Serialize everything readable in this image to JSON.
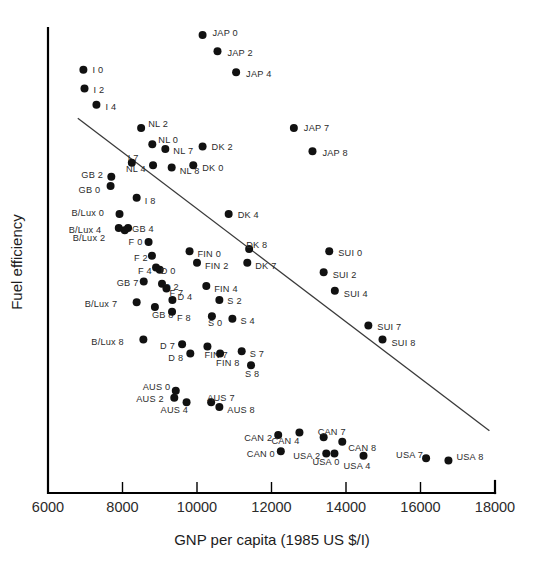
{
  "chart_data": {
    "type": "scatter",
    "title": "",
    "xlabel": "GNP per capita  (1985 US $/I)",
    "ylabel": "Fuel efficiency",
    "xlim": [
      6000,
      18000
    ],
    "ylim": [
      0,
      100
    ],
    "grid": false,
    "legend": "none",
    "xticks": [
      6000,
      8000,
      10000,
      12000,
      14000,
      16000,
      18000
    ],
    "xticklabels": [
      "6000",
      "8000",
      "10000",
      "12000",
      "14000",
      "16000",
      "18000"
    ],
    "yticks": [],
    "yticklabels": [],
    "trendline": {
      "label": "regression-line",
      "x": [
        6800,
        17850
      ],
      "y": [
        80.6,
        13.4
      ]
    },
    "points": [
      {
        "label": "JAP0",
        "text": "JAP 0",
        "x": 10150,
        "y": 98.5,
        "lx": 10.0,
        "ly": -1.5
      },
      {
        "label": "JAP2",
        "text": "JAP 2",
        "x": 10550,
        "y": 95.0,
        "lx": 10.0,
        "ly": 1.5
      },
      {
        "label": "JAP4",
        "text": "JAP 4",
        "x": 11050,
        "y": 90.5,
        "lx": 10.0,
        "ly": 2.0
      },
      {
        "label": "I0",
        "text": "I 0",
        "x": 6950,
        "y": 91.0,
        "lx": 9.0,
        "ly": 0.0
      },
      {
        "label": "I2",
        "text": "I 2",
        "x": 6980,
        "y": 87.0,
        "lx": 9.0,
        "ly": 2.0
      },
      {
        "label": "I4",
        "text": "I 4",
        "x": 7300,
        "y": 83.5,
        "lx": 9.0,
        "ly": 2.0
      },
      {
        "label": "NL2",
        "text": "NL 2",
        "x": 8500,
        "y": 78.5,
        "lx": 7.0,
        "ly": -3.5
      },
      {
        "label": "JAP7",
        "text": "JAP 7",
        "x": 12600,
        "y": 78.5,
        "lx": 10.0,
        "ly": 0.5
      },
      {
        "label": "NL0",
        "text": "NL 0",
        "x": 8800,
        "y": 75.0,
        "lx": 6.0,
        "ly": -4.0
      },
      {
        "label": "NL7",
        "text": "NL 7",
        "x": 9150,
        "y": 74.0,
        "lx": 8.0,
        "ly": 2.5
      },
      {
        "label": "DK2",
        "text": "DK 2",
        "x": 10150,
        "y": 74.5,
        "lx": 9.0,
        "ly": 0.5
      },
      {
        "label": "JAP8",
        "text": "JAP 8",
        "x": 13100,
        "y": 73.5,
        "lx": 10.0,
        "ly": 2.0
      },
      {
        "label": "I7",
        "text": "I 7",
        "x": 8250,
        "y": 71.0,
        "lx": -4.0,
        "ly": -4.5
      },
      {
        "label": "NL4",
        "text": "NL 4",
        "x": 8820,
        "y": 70.5,
        "lx": -27.0,
        "ly": 4.0
      },
      {
        "label": "NL8",
        "text": "NL 8",
        "x": 9320,
        "y": 70.0,
        "lx": 8.0,
        "ly": 3.0
      },
      {
        "label": "DK0",
        "text": "DK 0",
        "x": 9900,
        "y": 70.5,
        "lx": 9.0,
        "ly": 3.0
      },
      {
        "label": "GB2",
        "text": "GB 2",
        "x": 7700,
        "y": 68.0,
        "lx": -30.0,
        "ly": -2.0
      },
      {
        "label": "GB0",
        "text": "GB 0",
        "x": 7680,
        "y": 66.0,
        "lx": -32.0,
        "ly": 3.5
      },
      {
        "label": "I8",
        "text": "I 8",
        "x": 8380,
        "y": 63.5,
        "lx": 8.0,
        "ly": 3.0
      },
      {
        "label": "B/Lux0",
        "text": "B/Lux 0",
        "x": 7920,
        "y": 60.0,
        "lx": -48.0,
        "ly": -1.0
      },
      {
        "label": "DK4",
        "text": "DK 4",
        "x": 10850,
        "y": 60.0,
        "lx": 9.0,
        "ly": 1.0
      },
      {
        "label": "B/Lux4",
        "text": "B/Lux 4",
        "x": 7900,
        "y": 57.0,
        "lx": -50.0,
        "ly": 2.0
      },
      {
        "label": "GB4",
        "text": "GB 4",
        "x": 8150,
        "y": 57.0,
        "lx": 4.0,
        "ly": 1.5
      },
      {
        "label": "B/Lux2",
        "text": "B/Lux 2",
        "x": 8060,
        "y": 56.5,
        "lx": -52.0,
        "ly": 7.5
      },
      {
        "label": "F0",
        "text": "F 0",
        "x": 8700,
        "y": 54.0,
        "lx": -20.0,
        "ly": 0.0
      },
      {
        "label": "FIN0",
        "text": "FIN 0",
        "x": 9800,
        "y": 52.0,
        "lx": 8.0,
        "ly": 2.5
      },
      {
        "label": "DK8",
        "text": "DK 8",
        "x": 11400,
        "y": 52.5,
        "lx": -3.0,
        "ly": -4.0
      },
      {
        "label": "SUI0",
        "text": "SUI 0",
        "x": 13550,
        "y": 52.0,
        "lx": 9.0,
        "ly": 1.5
      },
      {
        "label": "F2",
        "text": "F 2",
        "x": 8790,
        "y": 51.0,
        "lx": -18.0,
        "ly": 2.5
      },
      {
        "label": "FIN2",
        "text": "FIN 2",
        "x": 10000,
        "y": 49.5,
        "lx": 8.0,
        "ly": 3.5
      },
      {
        "label": "DK7",
        "text": "DK 7",
        "x": 11350,
        "y": 49.5,
        "lx": 8.0,
        "ly": 3.0
      },
      {
        "label": "F4",
        "text": "F 4",
        "x": 8900,
        "y": 48.5,
        "lx": -18.0,
        "ly": 3.5
      },
      {
        "label": "D0",
        "text": "D 0",
        "x": 9000,
        "y": 48.0,
        "lx": 1.0,
        "ly": 1.0
      },
      {
        "label": "SUI2",
        "text": "SUI 2",
        "x": 13400,
        "y": 47.5,
        "lx": 9.0,
        "ly": 2.5
      },
      {
        "label": "GB7",
        "text": "GB 7",
        "x": 8570,
        "y": 45.5,
        "lx": -27.0,
        "ly": 1.5
      },
      {
        "label": "D2",
        "text": "D 2",
        "x": 9060,
        "y": 45.0,
        "lx": 2.0,
        "ly": 3.5
      },
      {
        "label": "F7",
        "text": "F 7",
        "x": 9180,
        "y": 44.0,
        "lx": 3.0,
        "ly": 5.0
      },
      {
        "label": "FIN4",
        "text": "FIN 4",
        "x": 10250,
        "y": 44.5,
        "lx": 8.0,
        "ly": 3.0
      },
      {
        "label": "SUI4",
        "text": "SUI 4",
        "x": 13700,
        "y": 43.5,
        "lx": 9.0,
        "ly": 3.0
      },
      {
        "label": "B/Lux7",
        "text": "B/Lux 7",
        "x": 8380,
        "y": 41.0,
        "lx": -52.0,
        "ly": 2.0
      },
      {
        "label": "D4",
        "text": "D 4",
        "x": 9340,
        "y": 41.5,
        "lx": 5.0,
        "ly": -3.0
      },
      {
        "label": "S2",
        "text": "S 2",
        "x": 10600,
        "y": 41.5,
        "lx": 8.0,
        "ly": 1.0
      },
      {
        "label": "GB8",
        "text": "GB 8",
        "x": 8870,
        "y": 40.0,
        "lx": -3.0,
        "ly": 8.0
      },
      {
        "label": "F8",
        "text": "F 8",
        "x": 9330,
        "y": 39.0,
        "lx": 5.0,
        "ly": 6.0
      },
      {
        "label": "S0",
        "text": "S 0",
        "x": 10400,
        "y": 38.0,
        "lx": -4.0,
        "ly": 7.0
      },
      {
        "label": "S4",
        "text": "S 4",
        "x": 10950,
        "y": 37.5,
        "lx": 8.0,
        "ly": 2.0
      },
      {
        "label": "SUI7",
        "text": "SUI 7",
        "x": 14600,
        "y": 36.0,
        "lx": 9.0,
        "ly": 1.5
      },
      {
        "label": "B/Lux8",
        "text": "B/Lux 8",
        "x": 8560,
        "y": 33.0,
        "lx": -52.0,
        "ly": 2.5
      },
      {
        "label": "SUI8",
        "text": "SUI 8",
        "x": 14980,
        "y": 33.0,
        "lx": 9.0,
        "ly": 3.0
      },
      {
        "label": "D7",
        "text": "D 7",
        "x": 9600,
        "y": 32.0,
        "lx": -22.0,
        "ly": 1.5
      },
      {
        "label": "FIN7",
        "text": "FIN 7",
        "x": 10280,
        "y": 31.5,
        "lx": -3.0,
        "ly": 8.0
      },
      {
        "label": "S7",
        "text": "S 7",
        "x": 11200,
        "y": 30.5,
        "lx": 8.0,
        "ly": 3.0
      },
      {
        "label": "D8",
        "text": "D 8",
        "x": 9820,
        "y": 30.0,
        "lx": -22.0,
        "ly": 4.0
      },
      {
        "label": "FIN8",
        "text": "FIN 8",
        "x": 10620,
        "y": 30.0,
        "lx": -4.0,
        "ly": 9.0
      },
      {
        "label": "S8",
        "text": "S 8",
        "x": 11450,
        "y": 27.5,
        "lx": -6.0,
        "ly": 9.0
      },
      {
        "label": "AUS0",
        "text": "AUS 0",
        "x": 9430,
        "y": 22.0,
        "lx": -33.0,
        "ly": -3.5
      },
      {
        "label": "AUS2",
        "text": "AUS 2",
        "x": 9390,
        "y": 20.5,
        "lx": -38.0,
        "ly": 1.5
      },
      {
        "label": "AUS4",
        "text": "AUS 4",
        "x": 9720,
        "y": 19.5,
        "lx": -26.0,
        "ly": 8.0
      },
      {
        "label": "AUS7",
        "text": "AUS 7",
        "x": 10380,
        "y": 19.5,
        "lx": -4.0,
        "ly": -4.0
      },
      {
        "label": "AUS8",
        "text": "AUS 8",
        "x": 10600,
        "y": 18.5,
        "lx": 8.0,
        "ly": 3.5
      },
      {
        "label": "CAN2",
        "text": "CAN 2",
        "x": 12180,
        "y": 12.5,
        "lx": -34.0,
        "ly": 3.0
      },
      {
        "label": "CAN7",
        "text": "CAN 7",
        "x": 13400,
        "y": 12.0,
        "lx": -6.0,
        "ly": -5.0
      },
      {
        "label": "CAN4",
        "text": "CAN 4",
        "x": 12750,
        "y": 13.0,
        "lx": -28.0,
        "ly": 8.0
      },
      {
        "label": "CAN8",
        "text": "CAN 8",
        "x": 13900,
        "y": 11.0,
        "lx": 6.0,
        "ly": 6.0
      },
      {
        "label": "CAN0",
        "text": "CAN 0",
        "x": 12250,
        "y": 9.0,
        "lx": -34.0,
        "ly": 3.0
      },
      {
        "label": "USA2",
        "text": "USA 2",
        "x": 13470,
        "y": 8.5,
        "lx": -33.0,
        "ly": 2.5
      },
      {
        "label": "USA0",
        "text": "USA 0",
        "x": 13690,
        "y": 8.5,
        "lx": -22.0,
        "ly": 9.0
      },
      {
        "label": "USA4",
        "text": "USA 4",
        "x": 14470,
        "y": 8.0,
        "lx": -20.0,
        "ly": 10.0
      },
      {
        "label": "USA7",
        "text": "USA 7",
        "x": 16150,
        "y": 7.5,
        "lx": -30.0,
        "ly": -3.5
      },
      {
        "label": "USA8",
        "text": "USA 8",
        "x": 16750,
        "y": 7.0,
        "lx": 8.0,
        "ly": -3.0
      }
    ]
  },
  "axes": {
    "x_title": "GNP per capita  (1985 US $/I)",
    "y_title": "Fuel efficiency"
  }
}
